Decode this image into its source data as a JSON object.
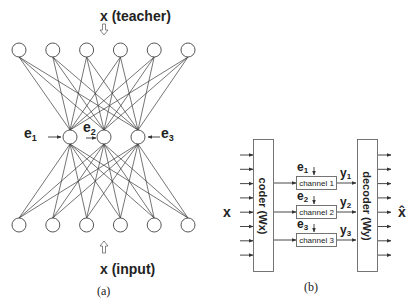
{
  "panel_a": {
    "teacher_label": "x (teacher)",
    "input_label": "x (input)",
    "caption": "(a)",
    "error_labels": [
      {
        "base": "e",
        "sub": "1"
      },
      {
        "base": "e",
        "sub": "2"
      },
      {
        "base": "e",
        "sub": "3"
      }
    ],
    "layers": {
      "top": {
        "count": 6
      },
      "hidden": {
        "count": 3
      },
      "bottom": {
        "count": 6
      }
    }
  },
  "panel_b": {
    "input_label": "x",
    "output_label": "x̂",
    "coder_label": "coder (Wx)",
    "decoder_label": "decoder (Wy)",
    "caption": "(b)",
    "channels": [
      {
        "label": "channel 1",
        "error": "e",
        "error_sub": "1",
        "output": "y",
        "output_sub": "1"
      },
      {
        "label": "channel 2",
        "error": "e",
        "error_sub": "2",
        "output": "y",
        "output_sub": "2"
      },
      {
        "label": "channel 3",
        "error": "e",
        "error_sub": "3",
        "output": "y",
        "output_sub": "3"
      }
    ],
    "input_arrow_count": 8,
    "output_arrow_count": 8
  }
}
